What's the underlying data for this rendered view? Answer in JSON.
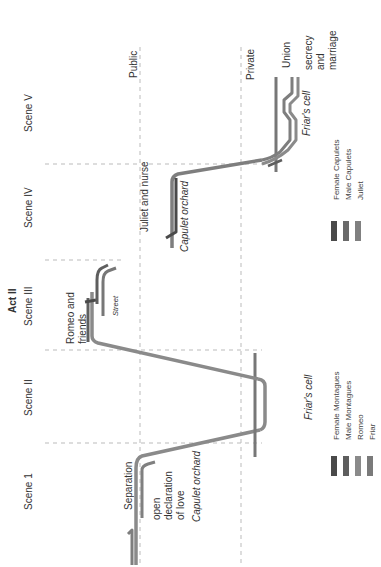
{
  "diagram": {
    "title": "Act II",
    "orientation": "rotated 90° counter-clockwise (time runs bottom to top)",
    "scenes": [
      {
        "label": "Scene 1"
      },
      {
        "label": "Scene II"
      },
      {
        "label": "Scene III"
      },
      {
        "label": "Scene IV"
      },
      {
        "label": "Scene V"
      }
    ],
    "zones": {
      "public": "Public",
      "private": "Private"
    },
    "locations": {
      "capulet_orchard_1": "Capulet orchard",
      "friars_cell_1": "Friar's cell",
      "street": "Street",
      "capulet_orchard_2": "Capulet orchard",
      "friars_cell_2": "Friar's cell"
    },
    "annotations": {
      "separation": "Separation",
      "open_declaration": [
        "open",
        "declaration",
        "of love"
      ],
      "romeo_and_friends": [
        "Romeo and",
        "friends"
      ],
      "juliet_and_nurse": "Juliet and nurse",
      "union": "Union",
      "secrecy_marriage": [
        "secrecy",
        "and",
        "marriage"
      ]
    },
    "legend_montagues": [
      {
        "label": "Female Montagues",
        "color": "#4a4a4a"
      },
      {
        "label": "Male Montagues",
        "color": "#5e5e5e"
      },
      {
        "label": "Romeo",
        "color": "#8a8a8a"
      },
      {
        "label": "Friar",
        "color": "#7a7a7a"
      }
    ],
    "legend_capulets": [
      {
        "label": "Female Capulets",
        "color": "#4a4a4a"
      },
      {
        "label": "Male Capulets",
        "color": "#6a6a6a"
      },
      {
        "label": "Juliet",
        "color": "#808080"
      }
    ],
    "colors": {
      "romeo_line": "#8a8a8a",
      "juliet_line": "#7e7e7e",
      "friar_line": "#777777",
      "male_line": "#5e5e5e",
      "grid": "#bbbbbb"
    }
  }
}
